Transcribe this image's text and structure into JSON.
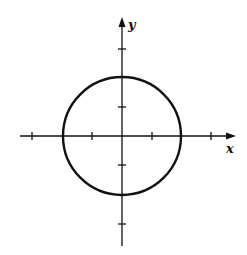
{
  "diagram": {
    "type": "circle-on-coordinate-axes",
    "axes": {
      "x_label": "x",
      "y_label": "y",
      "x_ticks": [
        -3,
        -1,
        1,
        3
      ],
      "y_ticks": [
        -3,
        -1,
        1,
        3
      ],
      "range": [
        -4,
        4
      ]
    },
    "circle": {
      "center": [
        0,
        0
      ],
      "radius": 2,
      "equation_implied": "x^2 + y^2 = 4"
    },
    "colors": {
      "stroke": "#111111",
      "background": "#ffffff"
    }
  }
}
